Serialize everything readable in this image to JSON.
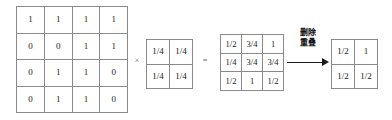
{
  "diagram": {
    "operators": {
      "multiply": "×",
      "equals": "="
    },
    "arrow": {
      "caption_line1": "删除",
      "caption_line2": "重叠",
      "icon": "right-arrow-icon"
    },
    "colors": {
      "background": "#ffffff",
      "grid_line": "#8a8a8a",
      "text": "#1a1a1a",
      "operator": "#666666",
      "arrow": "#1a1a1a"
    },
    "matrices": {
      "input": {
        "label": "input-matrix",
        "rows": 4,
        "cols": 4,
        "cells": [
          [
            "1",
            "1",
            "1",
            "1"
          ],
          [
            "0",
            "0",
            "1",
            "1"
          ],
          [
            "0",
            "1",
            "1",
            "0"
          ],
          [
            "0",
            "1",
            "1",
            "0"
          ]
        ]
      },
      "kernel": {
        "label": "kernel-matrix",
        "rows": 2,
        "cols": 2,
        "cells": [
          [
            "1/4",
            "1/4"
          ],
          [
            "1/4",
            "1/4"
          ]
        ]
      },
      "result": {
        "label": "result-matrix",
        "rows": 3,
        "cols": 3,
        "cells": [
          [
            "1/2",
            "3/4",
            "1"
          ],
          [
            "1/4",
            "3/4",
            "3/4"
          ],
          [
            "1/2",
            "1",
            "1/2"
          ]
        ]
      },
      "final": {
        "label": "final-matrix",
        "rows": 2,
        "cols": 2,
        "cells": [
          [
            "1/2",
            "1"
          ],
          [
            "1/2",
            "1/2"
          ]
        ]
      }
    }
  }
}
